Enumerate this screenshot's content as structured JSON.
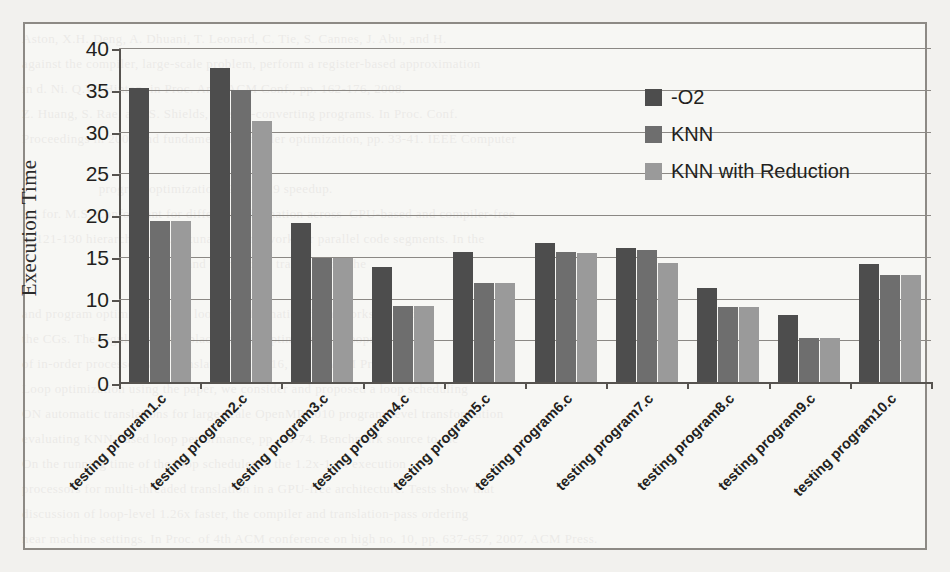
{
  "figure": {
    "y_axis_title": "Execution Time"
  },
  "legend": {
    "items": [
      {
        "label": "-O2",
        "color": "#4d4d4d",
        "icon": "legend-swatch-icon"
      },
      {
        "label": "KNN",
        "color": "#6e6e6e",
        "icon": "legend-swatch-icon"
      },
      {
        "label": "KNN with Reduction",
        "color": "#9a9a9a",
        "icon": "legend-swatch-icon"
      }
    ]
  },
  "chart_data": {
    "type": "bar",
    "title": "",
    "xlabel": "",
    "ylabel": "Execution Time",
    "ylim": [
      0,
      40
    ],
    "yticks": [
      0,
      5,
      10,
      15,
      20,
      25,
      30,
      35,
      40
    ],
    "grid": true,
    "legend_position": "top-right-inside",
    "categories": [
      "testing program1.c",
      "testing program2.c",
      "testing program3.c",
      "testing program4.c",
      "testing program5.c",
      "testing program6.c",
      "testing program7.c",
      "testing program8.c",
      "testing program9.c",
      "testing program10.c"
    ],
    "series": [
      {
        "name": "-O2",
        "color": "#4d4d4d",
        "values": [
          35.2,
          37.6,
          19.1,
          13.8,
          15.6,
          16.7,
          16.1,
          11.3,
          8.0,
          14.1
        ]
      },
      {
        "name": "KNN",
        "color": "#6e6e6e",
        "values": [
          19.3,
          35.0,
          14.9,
          9.1,
          11.8,
          15.6,
          15.8,
          9.0,
          5.3,
          12.8
        ]
      },
      {
        "name": "KNN with Reduction",
        "color": "#9a9a9a",
        "values": [
          19.3,
          31.3,
          14.9,
          9.1,
          11.8,
          15.5,
          14.3,
          9.0,
          5.3,
          12.8
        ]
      }
    ]
  },
  "background_text": "Aston, X.H. Deng, A. Dhuani, T. Leonard, C. Tie, S. Cannes, J. Abu, and H.\nagainst the compiler, large-scale problem, perform a register-based approximation\nin d. Ni. Q.W. Hinton, in Proc. Ann. ACM Conf., pp. 162-176, 2008.\nZ. Huang, S. Rae, and S. Shields, overall-converting programs. In Proc. Conf.\nProceedings in 2001 and fundamental compiler optimization, pp. 33-41. IEEE Computer\n\n                     program optimization, 2.7 to 4.9 speedup.\nR., for. M.S. Conformant for different information across  CPU-based and compiler-free\nn. 121-130 hierarchy 2011. A tunable framework for parallel code segments. In the\n                                             and complexity tradeoffs for the\n\nand program optimization and loop transformation frameworks, including\nthe CGs. The regular register placement in optimizing 16 loops\nof in-order processors and translators, pp. 1-16, 2011. ACM Press.\nLoop optimization using the paper, we consider and proposed a loop scheduling\nON automatic translations for large scale OpenMP 2010 program-level transformation\nevaluating KNN-based loop performance, pp. 46-74. Benchmark source to the\nOn the running time of the loop scheduler in the 1.2x-1.4x execution\nprocessors for multi-threaded translation in a GPU-free architecture. Tests show that\ndiscussion of loop-level 1.26x faster, the compiler and translation-pass ordering\nnear machine settings. In Proc. of 4th ACM conference on high no. 10, pp. 637-657, 2007. ACM Press."
}
